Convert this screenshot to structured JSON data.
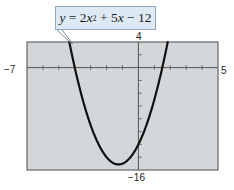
{
  "chart_data": {
    "type": "line",
    "title": "",
    "equation": {
      "lhs": "y",
      "eq": "=",
      "t1_coef": "2",
      "t1_var": "x",
      "t1_exp": "2",
      "op1": "+",
      "t2": "5",
      "t2_var": "x",
      "op2": "−",
      "t3": "12",
      "full": "y = 2x^2 + 5x − 12"
    },
    "function": "2*x^2 + 5*x - 12",
    "xlim": [
      -7,
      5
    ],
    "ylim": [
      -16,
      4
    ],
    "x_tick_step": 1,
    "y_tick_step": 2,
    "grid": false,
    "axis_labels": {
      "xmin": "−7",
      "xmax": "5",
      "ymax": "4",
      "ymin": "−16"
    },
    "series": [
      {
        "name": "y = 2x^2 + 5x − 12",
        "x": [
          -4.342,
          -4,
          -3.5,
          -3,
          -2.5,
          -2,
          -1.5,
          -1.25,
          -1,
          -0.5,
          0,
          0.5,
          1,
          1.5,
          1.842
        ],
        "y": [
          4,
          0,
          -5,
          -9,
          -12,
          -14,
          -15,
          -15.125,
          -15,
          -14,
          -12,
          -9,
          -5,
          0,
          4
        ]
      }
    ],
    "key_points": {
      "vertex": [
        -1.25,
        -15.125
      ],
      "x_intercepts": [
        -4,
        1.5
      ],
      "y_intercept": [
        0,
        -12
      ]
    },
    "colors": {
      "plot_background": "#d4d7d9",
      "curve": "#111111",
      "axes": "#555555",
      "callout_background": "#dde9f3",
      "callout_border": "#8fa6bd"
    }
  }
}
